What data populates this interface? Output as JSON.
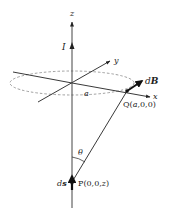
{
  "diagram": {
    "labels": {
      "z_axis": "z",
      "x_axis": "x",
      "y_axis": "y",
      "current": "I",
      "radius": "a",
      "field": "dB",
      "field_d": "d",
      "field_B": "B",
      "point_q": "Q(a,0,0)",
      "point_q_name": "Q(",
      "point_q_a": "a",
      "point_q_rest": ",0,0)",
      "point_p_name": "P(0,0,",
      "point_p_z": "z",
      "point_p_close": ")",
      "angle": "θ",
      "element": "ds",
      "element_d": "d",
      "element_s": "s"
    },
    "colors": {
      "stroke": "#222222",
      "dashed": "#888888",
      "background": "#ffffff"
    }
  }
}
